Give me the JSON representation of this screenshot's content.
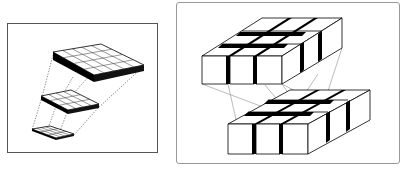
{
  "figure": {
    "left_panel": {
      "description": "pyramid of feature-map grids connected by dashed projection lines",
      "layers": [
        {
          "name": "top-layer",
          "rows": 4,
          "cols": 5
        },
        {
          "name": "middle-layer",
          "rows": 3,
          "cols": 4
        },
        {
          "name": "bottom-layer",
          "rows": 3,
          "cols": 4
        }
      ]
    },
    "right_panel": {
      "description": "two 3x3 arrays of 3D cubes with thin projection lines between them",
      "blocks": [
        {
          "name": "upper-cube-array",
          "rows": 3,
          "cols": 3
        },
        {
          "name": "lower-cube-array",
          "rows": 3,
          "cols": 3
        }
      ]
    },
    "colors": {
      "stroke": "#000000",
      "fill": "#ffffff",
      "shadow": "#000000",
      "frame": "#555555"
    }
  }
}
